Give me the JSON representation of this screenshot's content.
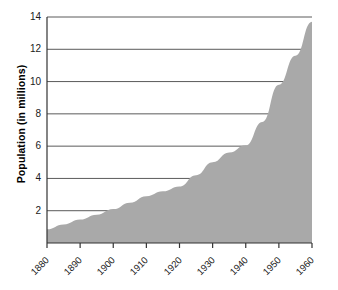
{
  "chart_data": {
    "type": "area",
    "title": "",
    "subtitle": "",
    "xlabel": "",
    "ylabel": "Population (in millions)",
    "xlim": [
      1880,
      1960
    ],
    "ylim": [
      0,
      14
    ],
    "grid": true,
    "legend": "none",
    "fill_color": "#a9a9a9",
    "gridline_color": "#5a5a5a",
    "axis_color": "#333333",
    "x_tick_labels": [
      "1880",
      "1890",
      "1900",
      "1910",
      "1920",
      "1930",
      "1940",
      "1950",
      "1960"
    ],
    "y_tick_labels": [
      "2",
      "4",
      "6",
      "8",
      "10",
      "12",
      "14"
    ],
    "x": [
      1880,
      1885,
      1890,
      1895,
      1900,
      1905,
      1910,
      1915,
      1920,
      1925,
      1930,
      1935,
      1940,
      1945,
      1950,
      1955,
      1960
    ],
    "values": [
      0.85,
      1.15,
      1.45,
      1.75,
      2.1,
      2.5,
      2.9,
      3.2,
      3.5,
      4.2,
      5.0,
      5.6,
      6.05,
      7.5,
      9.8,
      11.6,
      13.7
    ],
    "series": [
      {
        "name": "Population",
        "values": [
          0.85,
          1.15,
          1.45,
          1.75,
          2.1,
          2.5,
          2.9,
          3.2,
          3.5,
          4.2,
          5.0,
          5.6,
          6.05,
          7.5,
          9.8,
          11.6,
          13.7
        ]
      }
    ]
  }
}
